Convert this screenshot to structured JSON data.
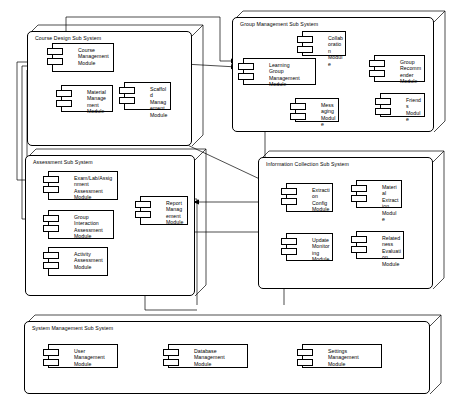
{
  "diagram": {
    "type": "uml-component-diagram",
    "stroke_color": "#000000",
    "fill_color": "#ffffff",
    "width": 451,
    "height": 412
  },
  "subsystems": [
    {
      "id": "course-design",
      "label": "Course Design Sub System",
      "x": 27,
      "y": 31,
      "w": 165,
      "h": 115,
      "modules": [
        {
          "id": "course-management",
          "lines": [
            "Course",
            "Management",
            "Module"
          ],
          "x": 52,
          "y": 43,
          "w": 62,
          "h": 29
        },
        {
          "id": "material-management",
          "lines": [
            "Material",
            "Management",
            "Module"
          ],
          "x": 61,
          "y": 85,
          "w": 52,
          "h": 27
        },
        {
          "id": "scaffold-management",
          "lines": [
            "Scaffold",
            "Management",
            "Module"
          ],
          "x": 124,
          "y": 82,
          "w": 47,
          "h": 28
        }
      ]
    },
    {
      "id": "group-management",
      "label": "Group Management Sub System",
      "x": 232,
      "y": 17,
      "w": 202,
      "h": 115,
      "modules": [
        {
          "id": "learning-group-management",
          "lines": [
            "Learning",
            "Group Management",
            "Module"
          ],
          "x": 243,
          "y": 58,
          "w": 73,
          "h": 27
        },
        {
          "id": "collaboration",
          "lines": [
            "Collaboration",
            "Module"
          ],
          "x": 302,
          "y": 31,
          "w": 44,
          "h": 25
        },
        {
          "id": "group-recommender",
          "lines": [
            "Group",
            "Recommender",
            "Module"
          ],
          "x": 374,
          "y": 55,
          "w": 51,
          "h": 27
        },
        {
          "id": "messaging",
          "lines": [
            "Messaging",
            "Module"
          ],
          "x": 295,
          "y": 98,
          "w": 44,
          "h": 24
        },
        {
          "id": "friends",
          "lines": [
            "Friends",
            "Module"
          ],
          "x": 380,
          "y": 93,
          "w": 45,
          "h": 24
        }
      ]
    },
    {
      "id": "assessment",
      "label": "Assessment Sub System",
      "x": 25,
      "y": 155,
      "w": 170,
      "h": 141,
      "modules": [
        {
          "id": "exam-lab-assignment-assessment",
          "lines": [
            "Exam/Lab/Assignment",
            "Assessment",
            "Module"
          ],
          "x": 48,
          "y": 171,
          "w": 70,
          "h": 29
        },
        {
          "id": "group-interaction-assessment",
          "lines": [
            "Group Interaction",
            "Assessment",
            "Module"
          ],
          "x": 48,
          "y": 210,
          "w": 66,
          "h": 29
        },
        {
          "id": "activity-assessment",
          "lines": [
            "Activity",
            "Assessment",
            "Module"
          ],
          "x": 48,
          "y": 247,
          "w": 60,
          "h": 29
        },
        {
          "id": "report-management",
          "lines": [
            "Report",
            "Management",
            "Module"
          ],
          "x": 140,
          "y": 196,
          "w": 48,
          "h": 29
        }
      ]
    },
    {
      "id": "information-collection",
      "label": "Information Collection Sub System",
      "x": 258,
      "y": 157,
      "w": 175,
      "h": 132,
      "modules": [
        {
          "id": "extraction-config",
          "lines": [
            "Extraction",
            "Config",
            "Module"
          ],
          "x": 286,
          "y": 183,
          "w": 47,
          "h": 29
        },
        {
          "id": "material-extraction",
          "lines": [
            "Material",
            "Extraction",
            "Module"
          ],
          "x": 356,
          "y": 180,
          "w": 46,
          "h": 28
        },
        {
          "id": "update-monitoring",
          "lines": [
            "Update",
            "Monitoring",
            "Module"
          ],
          "x": 286,
          "y": 233,
          "w": 47,
          "h": 28
        },
        {
          "id": "relatedness-evaluation",
          "lines": [
            "Relatedness",
            "Evaluation",
            "Module"
          ],
          "x": 356,
          "y": 231,
          "w": 48,
          "h": 28
        }
      ]
    },
    {
      "id": "system-management",
      "label": "System Management Sub System",
      "x": 24,
      "y": 321,
      "w": 406,
      "h": 73,
      "modules": [
        {
          "id": "user-management",
          "lines": [
            "User Management",
            "Module"
          ],
          "x": 48,
          "y": 344,
          "w": 70,
          "h": 24
        },
        {
          "id": "database-management",
          "lines": [
            "Database Management",
            "Module"
          ],
          "x": 168,
          "y": 344,
          "w": 80,
          "h": 24
        },
        {
          "id": "settings-management",
          "lines": [
            "Settings Management",
            "Module"
          ],
          "x": 302,
          "y": 344,
          "w": 80,
          "h": 24
        }
      ]
    }
  ],
  "connections": [
    {
      "id": "course-mgmt-to-material-mgmt",
      "from": "course-management",
      "to": "material-management"
    },
    {
      "id": "course-mgmt-to-scaffold-mgmt",
      "from": "course-management",
      "to": "scaffold-management"
    },
    {
      "id": "course-mgmt-to-material-mgmt-2",
      "from": "course-management",
      "to": "material-management"
    },
    {
      "id": "course-mgmt-to-learning-group-mgmt",
      "from": "course-management",
      "to": "learning-group-management"
    },
    {
      "id": "course-mgmt-to-exam-assessment",
      "from": "course-management",
      "to": "exam-lab-assignment-assessment"
    },
    {
      "id": "course-mgmt-to-group-assessment",
      "from": "course-management",
      "to": "group-interaction-assessment"
    },
    {
      "id": "course-mgmt-to-activity-assessment",
      "from": "course-management",
      "to": "activity-assessment"
    },
    {
      "id": "top-route-to-learning-group-mgmt",
      "from": "course-management",
      "to": "learning-group-management"
    },
    {
      "id": "material-mgmt-to-extraction-config",
      "from": "material-management",
      "to": "extraction-config"
    },
    {
      "id": "learning-group-to-collaboration",
      "from": "learning-group-management",
      "to": "collaboration"
    },
    {
      "id": "learning-group-to-recommender",
      "from": "learning-group-management",
      "to": "group-recommender"
    },
    {
      "id": "learning-group-to-messaging",
      "from": "learning-group-management",
      "to": "messaging"
    },
    {
      "id": "learning-group-to-friends",
      "from": "learning-group-management",
      "to": "friends"
    },
    {
      "id": "group-assessment-to-learning-group",
      "from": "group-interaction-assessment",
      "to": "learning-group-management"
    },
    {
      "id": "report-mgmt-to-exam-assessment",
      "from": "report-management",
      "to": "exam-lab-assignment-assessment"
    },
    {
      "id": "report-mgmt-to-group-assessment",
      "from": "report-management",
      "to": "group-interaction-assessment"
    },
    {
      "id": "information-to-report-mgmt",
      "from": "information-collection",
      "to": "report-management"
    },
    {
      "id": "extraction-config-to-material-extr",
      "from": "extraction-config",
      "to": "material-extraction"
    },
    {
      "id": "extraction-config-to-update-monitor",
      "from": "extraction-config",
      "to": "update-monitoring"
    },
    {
      "id": "extraction-config-to-relatedness",
      "from": "extraction-config",
      "to": "relatedness-evaluation"
    }
  ]
}
